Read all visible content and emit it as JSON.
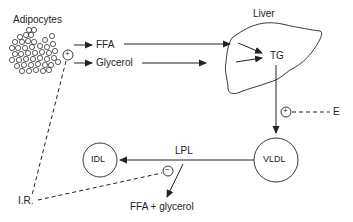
{
  "diagram": {
    "nodes": {
      "adipocytes": "Adipocytes",
      "liver": "Liver",
      "ffa": "FFA",
      "glycerol": "Glycerol",
      "tg": "TG",
      "vldl": "VLDL",
      "idl": "IDL",
      "lpl": "LPL",
      "ffa_glycerol": "FFA + glycerol",
      "estrogen": "E",
      "insulin_resistance": "I.R."
    },
    "signs": {
      "plus": "+",
      "minus": "−"
    },
    "edges": [
      {
        "from": "Adipocytes",
        "to": "FFA",
        "type": "arrow"
      },
      {
        "from": "Adipocytes",
        "to": "Glycerol",
        "type": "arrow"
      },
      {
        "from": "FFA",
        "to": "TG",
        "type": "arrow"
      },
      {
        "from": "Glycerol",
        "to": "TG",
        "type": "arrow"
      },
      {
        "from": "TG",
        "to": "VLDL",
        "type": "arrow"
      },
      {
        "from": "VLDL",
        "to": "IDL",
        "type": "arrow",
        "label": "LPL"
      },
      {
        "from": "LPL",
        "to": "FFA + glycerol",
        "type": "arrow"
      },
      {
        "from": "E",
        "to": "TG→VLDL",
        "type": "dashed",
        "effect": "+"
      },
      {
        "from": "I.R.",
        "to": "Adipocytes",
        "type": "dashed",
        "effect": "+"
      },
      {
        "from": "I.R.",
        "to": "LPL",
        "type": "dashed",
        "effect": "−"
      }
    ],
    "colors": {
      "line": "#222222",
      "background": "#ffffff"
    }
  }
}
